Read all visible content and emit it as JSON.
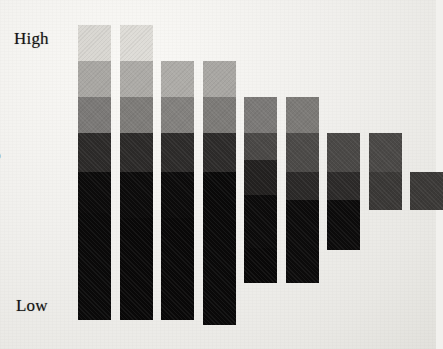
{
  "figure": {
    "background_color": "#f1f0ed",
    "axis": {
      "y_label": "Brightness",
      "y_top_tick": "High",
      "y_bottom_tick": "Low"
    }
  },
  "chart_data": {
    "type": "bar",
    "title": "",
    "xlabel": "",
    "ylabel": "Brightness",
    "grid": false,
    "legend": "none",
    "stacked": true,
    "orientation": "vertical",
    "ylim_labels": [
      "Low",
      "High"
    ],
    "categories": [
      "1",
      "2",
      "3",
      "4",
      "5",
      "6",
      "7",
      "8",
      "9"
    ],
    "brightness_levels": [
      {
        "level": 1,
        "name": "lightest",
        "color": "#d8d6d1"
      },
      {
        "level": 2,
        "name": "light",
        "color": "#a9a7a3"
      },
      {
        "level": 3,
        "name": "mid",
        "color": "#7c7a77"
      },
      {
        "level": 4,
        "name": "dark",
        "color": "#4a4846"
      },
      {
        "level": 5,
        "name": "darker",
        "color": "#2a2827"
      },
      {
        "level": 6,
        "name": "black",
        "color": "#0c0b0b"
      },
      {
        "level": 7,
        "name": "black2",
        "color": "#090808"
      },
      {
        "level": 8,
        "name": "black3",
        "color": "#070606"
      }
    ],
    "plot_area_px": {
      "x": 72,
      "y": 18,
      "width": 352,
      "height": 312,
      "baseline_y": 320
    },
    "bar_geometry_px": {
      "width": 33,
      "pitch": 41.5,
      "first_left": 78
    },
    "bars": [
      {
        "index": 1,
        "top_y": 25,
        "bottom_y": 320,
        "total_height": 295,
        "segments": [
          {
            "color": "#d9d7d2",
            "top": 25,
            "bottom": 61
          },
          {
            "color": "#a9a7a3",
            "top": 61,
            "bottom": 97
          },
          {
            "color": "#7b7977",
            "top": 97,
            "bottom": 133
          },
          {
            "color": "#2c2a29",
            "top": 133,
            "bottom": 172
          },
          {
            "color": "#0c0b0b",
            "top": 172,
            "bottom": 213
          },
          {
            "color": "#0a0909",
            "top": 213,
            "bottom": 320
          }
        ]
      },
      {
        "index": 2,
        "top_y": 25,
        "bottom_y": 320,
        "total_height": 295,
        "segments": [
          {
            "color": "#dedcd7",
            "top": 25,
            "bottom": 61
          },
          {
            "color": "#adaba7",
            "top": 61,
            "bottom": 97
          },
          {
            "color": "#7e7c79",
            "top": 97,
            "bottom": 133
          },
          {
            "color": "#2c2a29",
            "top": 133,
            "bottom": 172
          },
          {
            "color": "#0c0b0b",
            "top": 172,
            "bottom": 218
          },
          {
            "color": "#090808",
            "top": 218,
            "bottom": 320
          }
        ]
      },
      {
        "index": 3,
        "top_y": 61,
        "bottom_y": 320,
        "total_height": 259,
        "segments": [
          {
            "color": "#aeaca8",
            "top": 61,
            "bottom": 97
          },
          {
            "color": "#83817e",
            "top": 97,
            "bottom": 133
          },
          {
            "color": "#2d2b2a",
            "top": 133,
            "bottom": 172
          },
          {
            "color": "#0c0b0b",
            "top": 172,
            "bottom": 218
          },
          {
            "color": "#090808",
            "top": 218,
            "bottom": 320
          }
        ]
      },
      {
        "index": 4,
        "top_y": 61,
        "bottom_y": 325,
        "total_height": 264,
        "segments": [
          {
            "color": "#a9a7a3",
            "top": 61,
            "bottom": 97
          },
          {
            "color": "#7d7b78",
            "top": 97,
            "bottom": 133
          },
          {
            "color": "#2d2b2a",
            "top": 133,
            "bottom": 172
          },
          {
            "color": "#0a0909",
            "top": 172,
            "bottom": 325
          }
        ]
      },
      {
        "index": 5,
        "top_y": 97,
        "bottom_y": 283,
        "total_height": 186,
        "segments": [
          {
            "color": "#7b7977",
            "top": 97,
            "bottom": 133
          },
          {
            "color": "#4a4846",
            "top": 133,
            "bottom": 160
          },
          {
            "color": "#232120",
            "top": 160,
            "bottom": 195
          },
          {
            "color": "#0c0b0b",
            "top": 195,
            "bottom": 248
          },
          {
            "color": "#090808",
            "top": 248,
            "bottom": 283
          }
        ]
      },
      {
        "index": 6,
        "top_y": 97,
        "bottom_y": 283,
        "total_height": 186,
        "segments": [
          {
            "color": "#7c7a77",
            "top": 97,
            "bottom": 133
          },
          {
            "color": "#4c4a48",
            "top": 133,
            "bottom": 172
          },
          {
            "color": "#2b2928",
            "top": 172,
            "bottom": 200
          },
          {
            "color": "#0c0b0b",
            "top": 200,
            "bottom": 283
          }
        ]
      },
      {
        "index": 7,
        "top_y": 133,
        "bottom_y": 250,
        "total_height": 117,
        "segments": [
          {
            "color": "#4a4846",
            "top": 133,
            "bottom": 172
          },
          {
            "color": "#2c2a29",
            "top": 172,
            "bottom": 200
          },
          {
            "color": "#0c0b0b",
            "top": 200,
            "bottom": 250
          }
        ]
      },
      {
        "index": 8,
        "top_y": 133,
        "bottom_y": 210,
        "total_height": 77,
        "segments": [
          {
            "color": "#4a4846",
            "top": 133,
            "bottom": 172
          },
          {
            "color": "#3a3836",
            "top": 172,
            "bottom": 210
          }
        ]
      },
      {
        "index": 9,
        "top_y": 172,
        "bottom_y": 210,
        "total_height": 38,
        "segments": [
          {
            "color": "#3b3937",
            "top": 172,
            "bottom": 210
          }
        ]
      }
    ]
  }
}
